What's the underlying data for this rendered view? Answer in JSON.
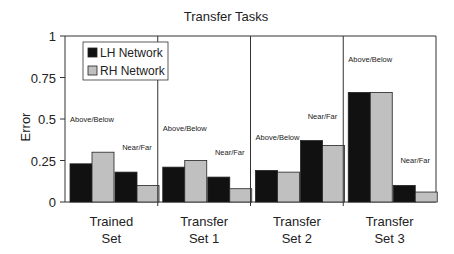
{
  "chart_data": {
    "type": "bar",
    "title": "Transfer Tasks",
    "xlabel": "",
    "ylabel": "Error",
    "ylim": [
      0,
      1
    ],
    "yticks": [
      "0",
      "0.25",
      "0.5",
      "0.75",
      "1"
    ],
    "grid": false,
    "legend": {
      "position": "upper-left-inside",
      "entries": [
        "LH Network",
        "RH Network"
      ]
    },
    "groups": [
      {
        "label_line1": "Trained",
        "label_line2": "Set"
      },
      {
        "label_line1": "Transfer",
        "label_line2": "Set 1"
      },
      {
        "label_line1": "Transfer",
        "label_line2": "Set 2"
      },
      {
        "label_line1": "Transfer",
        "label_line2": "Set 3"
      }
    ],
    "subcategories": [
      "Above/Below",
      "Near/Far"
    ],
    "series": [
      {
        "name": "LH Network",
        "color": "#111111",
        "values": [
          [
            0.23,
            0.18
          ],
          [
            0.21,
            0.15
          ],
          [
            0.19,
            0.37
          ],
          [
            0.66,
            0.1
          ]
        ]
      },
      {
        "name": "RH Network",
        "color": "#c0c0c0",
        "values": [
          [
            0.3,
            0.1
          ],
          [
            0.25,
            0.08
          ],
          [
            0.18,
            0.34
          ],
          [
            0.66,
            0.06
          ]
        ]
      }
    ]
  }
}
